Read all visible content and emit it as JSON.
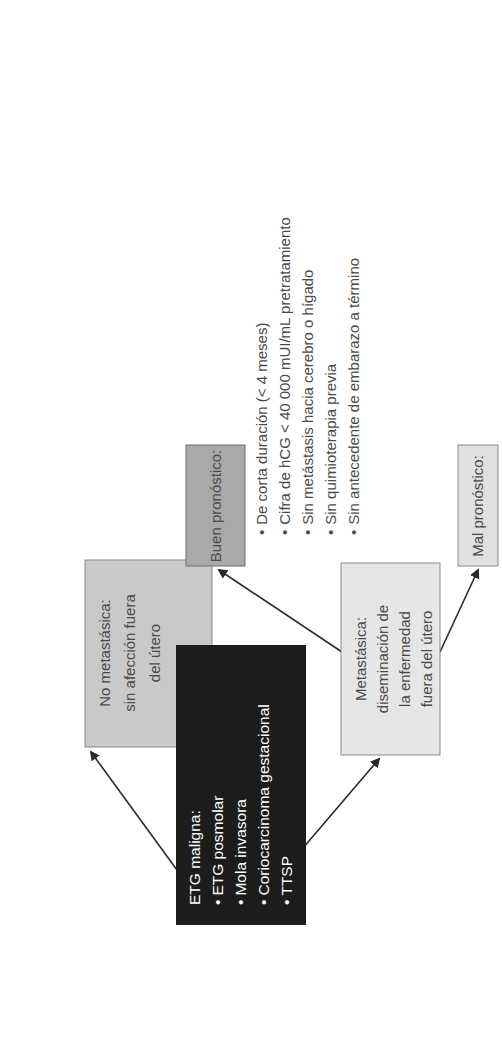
{
  "diagram": {
    "root": {
      "title": "ETG maligna:",
      "items": [
        "ETG posmolar",
        "Mola invasora",
        "Coriocarcinoma gestacional",
        "TTSP"
      ],
      "color": "#1c1c1c"
    },
    "non_metastatic": {
      "lines": [
        "No metastásica:",
        "sin afección fuera",
        "del útero"
      ],
      "color": "#c9c9c9"
    },
    "metastatic": {
      "lines": [
        "Metastásica:",
        "diseminación de",
        "la enfermedad",
        "fuera del útero"
      ],
      "color": "#e6e6e6"
    },
    "good_prognosis": {
      "label": "Buen pronóstico:",
      "color": "#a9a9a9",
      "criteria": [
        "De corta duración (< 4 meses)",
        "Cifra de hCG < 40 000 mUI/mL pretratamiento",
        "Sin metástasis hacia cerebro o hígado",
        "Sin quimioterapia previa",
        "Sin antecedente de embarazo a término"
      ]
    },
    "poor_prognosis": {
      "label": "Mal pronóstico:",
      "color": "#e0e0e0"
    },
    "bullet": "•",
    "edges": [
      {
        "from": "root",
        "to": "non_metastatic"
      },
      {
        "from": "root",
        "to": "metastatic"
      },
      {
        "from": "metastatic",
        "to": "good_prognosis"
      },
      {
        "from": "metastatic",
        "to": "poor_prognosis"
      }
    ]
  }
}
